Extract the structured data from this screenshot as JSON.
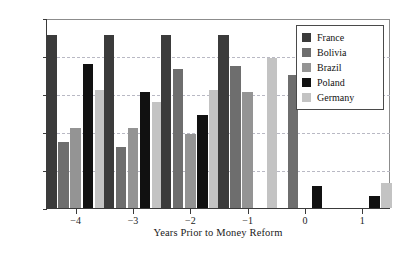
{
  "chart_data": {
    "type": "bar",
    "title": "",
    "subtitle": "",
    "xlabel": "Years Prior to Money Reform",
    "ylabel": "",
    "categories": [
      "−4",
      "−3",
      "−2",
      "−1",
      "0",
      "1"
    ],
    "ylim": [
      0,
      100
    ],
    "yticks": [
      0,
      20,
      40,
      60,
      80,
      100
    ],
    "ytick_labels": [
      "0%",
      "20%",
      "40%",
      "60%",
      "80%",
      "100%"
    ],
    "grid": "horizontal-dashed",
    "legend_position": "top-right-inside",
    "value_unit": "percent",
    "series": [
      {
        "name": "France",
        "color": "#3b3b3b",
        "values": [
          91,
          91,
          91,
          91,
          null,
          null
        ]
      },
      {
        "name": "Bolivia",
        "color": "#6e6e6e",
        "values": [
          35,
          32,
          73,
          75,
          70,
          null
        ]
      },
      {
        "name": "Brazil",
        "color": "#949494",
        "values": [
          42,
          42,
          39,
          61,
          null,
          null
        ]
      },
      {
        "name": "Poland",
        "color": "#111111",
        "values": [
          76,
          61,
          49,
          null,
          11.5,
          6.5
        ]
      },
      {
        "name": "Germany",
        "color": "#c3c3c3",
        "values": [
          62,
          56,
          62,
          79,
          null,
          13
        ]
      }
    ]
  },
  "legend": {
    "entries": [
      {
        "label": "France",
        "swatch": "#3b3b3b"
      },
      {
        "label": "Bolivia",
        "swatch": "#6e6e6e"
      },
      {
        "label": "Brazil",
        "swatch": "#949494"
      },
      {
        "label": "Poland",
        "swatch": "#111111"
      },
      {
        "label": "Germany",
        "swatch": "#c3c3c3"
      }
    ]
  },
  "axes": {
    "x_title": "Years Prior to Money Reform",
    "x_tick_labels": [
      "−4",
      "−3",
      "−2",
      "−1",
      "0",
      "1"
    ],
    "y_tick_labels": [
      "0%",
      "20%",
      "40%",
      "60%",
      "80%",
      "100%"
    ]
  },
  "style": {
    "axis_color": "#3a3a3a",
    "grid_color": "#b9b9c4",
    "background": "#ffffff",
    "text_color": "#1a1a1a"
  }
}
